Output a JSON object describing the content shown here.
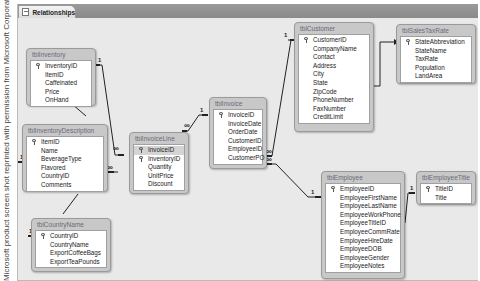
{
  "credit": "Microsoft product screen shot reprinted with permission from Microsoft Corporation.",
  "window": {
    "tab_label": "Relationships",
    "tab_icon": "relationships-icon"
  },
  "tables": {
    "tblInventory": {
      "title": "tblInventory",
      "fields": [
        "InventoryID",
        "ItemID",
        "Caffeinated",
        "Price",
        "OnHand"
      ],
      "keys": [
        "InventoryID"
      ]
    },
    "tblInventoryDescription": {
      "title": "tblInventoryDescription",
      "fields": [
        "ItemID",
        "Name",
        "BeverageType",
        "Flavored",
        "CountryID",
        "Comments"
      ],
      "keys": [
        "ItemID"
      ]
    },
    "tblCountryName": {
      "title": "tblCountryName",
      "fields": [
        "CountryID",
        "CountryName",
        "ExportCoffeeBags",
        "ExportTeaPounds"
      ],
      "keys": [
        "CountryID"
      ]
    },
    "tblInvoiceLine": {
      "title": "tblInvoiceLine",
      "fields": [
        "InvoiceID",
        "InventoryID",
        "Quantity",
        "UnitPrice",
        "Discount"
      ],
      "keys": [
        "InvoiceID",
        "InventoryID"
      ]
    },
    "tblInvoice": {
      "title": "tblInvoice",
      "fields": [
        "InvoiceID",
        "InvoiceDate",
        "OrderDate",
        "CustomerID",
        "EmployeeID",
        "CustomerPO"
      ],
      "keys": [
        "InvoiceID"
      ]
    },
    "tblCustomer": {
      "title": "tblCustomer",
      "fields": [
        "CustomerID",
        "CompanyName",
        "Contact",
        "Address",
        "City",
        "State",
        "ZipCode",
        "PhoneNumber",
        "FaxNumber",
        "CreditLimit"
      ],
      "keys": [
        "CustomerID"
      ]
    },
    "tblSalesTaxRate": {
      "title": "tblSalesTaxRate",
      "fields": [
        "StateAbbreviation",
        "StateName",
        "TaxRate",
        "Population",
        "LandArea"
      ],
      "keys": [
        "StateAbbreviation"
      ]
    },
    "tblEmployee": {
      "title": "tblEmployee",
      "fields": [
        "EmployeeID",
        "EmployeeFirstName",
        "EmployeeLastName",
        "EmployeeWorkPhone",
        "EmployeeTitleID",
        "EmployeeCommRate",
        "EmployeeHireDate",
        "EmployeeDOB",
        "EmployeeGender",
        "EmployeeNotes"
      ],
      "keys": [
        "EmployeeID"
      ]
    },
    "tblEmployeeTitle": {
      "title": "tblEmployeeTitle",
      "fields": [
        "TitleID",
        "Title"
      ],
      "keys": [
        "TitleID"
      ]
    }
  },
  "relationships": [
    {
      "from": "tblInventory.InventoryID",
      "to": "tblInvoiceLine.InventoryID",
      "from_card": "1",
      "to_card": "∞"
    },
    {
      "from": "tblInventoryDescription.ItemID",
      "to": "tblInventory.ItemID",
      "from_card": "1",
      "to_card": "∞"
    },
    {
      "from": "tblCountryName.CountryID",
      "to": "tblInventoryDescription.CountryID",
      "from_card": "1",
      "to_card": "∞"
    },
    {
      "from": "tblInvoice.InvoiceID",
      "to": "tblInvoiceLine.InvoiceID",
      "from_card": "1",
      "to_card": "∞"
    },
    {
      "from": "tblCustomer.CustomerID",
      "to": "tblInvoice.CustomerID",
      "from_card": "1",
      "to_card": "∞"
    },
    {
      "from": "tblEmployee.EmployeeID",
      "to": "tblInvoice.EmployeeID",
      "from_card": "1",
      "to_card": "∞"
    },
    {
      "from": "tblCustomer.State",
      "to": "tblSalesTaxRate.StateAbbreviation",
      "from_card": "",
      "to_card": ""
    },
    {
      "from": "tblEmployeeTitle.TitleID",
      "to": "tblEmployee.EmployeeTitleID",
      "from_card": "1",
      "to_card": "∞"
    }
  ],
  "labels": {
    "one": "1",
    "many": "∞"
  }
}
